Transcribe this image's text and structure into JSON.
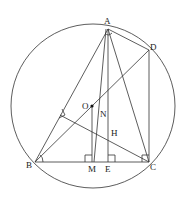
{
  "diagram": {
    "type": "geometry",
    "circle": {
      "center": "O",
      "cx": 93,
      "cy": 106,
      "r": 82
    },
    "points": {
      "A": {
        "label": "A",
        "x": 108,
        "y": 29
      },
      "B": {
        "label": "B",
        "x": 35,
        "y": 162
      },
      "C": {
        "label": "C",
        "x": 149,
        "y": 162
      },
      "D": {
        "label": "D",
        "x": 149,
        "y": 50
      },
      "O": {
        "label": "O",
        "x": 92,
        "y": 106
      },
      "M": {
        "label": "M",
        "x": 93,
        "y": 162
      },
      "E": {
        "label": "E",
        "x": 108,
        "y": 162
      },
      "H": {
        "label": "H",
        "x": 108,
        "y": 136
      },
      "N": {
        "label": "N",
        "x": 100,
        "y": 117
      }
    },
    "segments": [
      "AB",
      "AC",
      "AD",
      "AE",
      "AM",
      "BC",
      "BD",
      "CD",
      "CF",
      "OM"
    ],
    "right_angles": [
      "M",
      "E",
      "C",
      "F",
      "A"
    ]
  }
}
